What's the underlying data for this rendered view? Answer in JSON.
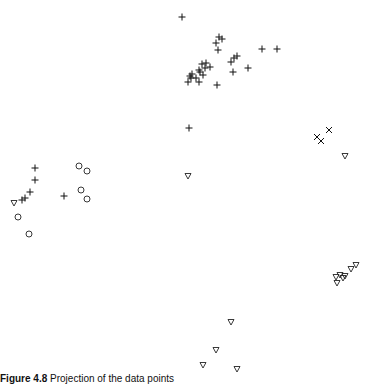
{
  "figure": {
    "caption_label": "Figure 4.8",
    "caption_text": "Projection of the data points"
  },
  "chart_data": {
    "type": "scatter",
    "title": "",
    "xlabel": "",
    "ylabel": "",
    "axes_visible": false,
    "grid": false,
    "legend": null,
    "coordinate_system": "pixel (x right, y down), 372x372 plot area",
    "series": [
      {
        "name": "plus",
        "marker": "+",
        "points": [
          [
            182,
            17
          ],
          [
            219,
            37
          ],
          [
            222,
            39
          ],
          [
            216,
            43
          ],
          [
            218,
            50
          ],
          [
            234,
            58
          ],
          [
            231,
            62
          ],
          [
            237,
            56
          ],
          [
            262,
            49
          ],
          [
            277,
            49
          ],
          [
            248,
            68
          ],
          [
            233,
            72
          ],
          [
            217,
            85
          ],
          [
            202,
            64
          ],
          [
            206,
            63
          ],
          [
            205,
            68
          ],
          [
            210,
            67
          ],
          [
            199,
            70
          ],
          [
            192,
            74
          ],
          [
            190,
            76
          ],
          [
            191,
            78
          ],
          [
            188,
            82
          ],
          [
            196,
            78
          ],
          [
            199,
            82
          ],
          [
            200,
            72
          ],
          [
            203,
            75
          ],
          [
            189,
            128
          ],
          [
            35,
            168
          ],
          [
            35,
            180
          ],
          [
            30,
            192
          ],
          [
            25,
            198
          ],
          [
            22,
            200
          ],
          [
            64,
            196
          ]
        ]
      },
      {
        "name": "circle",
        "marker": "o",
        "points": [
          [
            79,
            166
          ],
          [
            87,
            171
          ],
          [
            81,
            190
          ],
          [
            87,
            199
          ],
          [
            18,
            217
          ],
          [
            29,
            234
          ]
        ]
      },
      {
        "name": "triangle",
        "marker": "v",
        "points": [
          [
            14,
            203
          ],
          [
            345,
            156
          ],
          [
            188,
            176
          ],
          [
            356,
            265
          ],
          [
            351,
            269
          ],
          [
            345,
            276
          ],
          [
            340,
            275
          ],
          [
            336,
            277
          ],
          [
            337,
            283
          ],
          [
            343,
            278
          ],
          [
            231,
            322
          ],
          [
            216,
            350
          ],
          [
            203,
            365
          ],
          [
            237,
            369
          ]
        ]
      },
      {
        "name": "cross",
        "marker": "x",
        "points": [
          [
            329,
            130
          ],
          [
            317,
            137
          ],
          [
            321,
            141
          ]
        ]
      }
    ]
  }
}
